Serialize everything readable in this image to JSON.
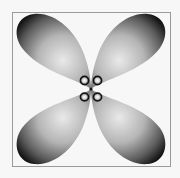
{
  "diagram": {
    "lobe_count": 4,
    "inner_lobe_count": 4,
    "orientation": "diagonal",
    "colors": {
      "background": "#f7f7f7",
      "frame": "#9a9a9a",
      "lobe_highlight": "#e8e8e8",
      "lobe_mid": "#9c9c9c",
      "lobe_edge": "#1c1c1c"
    }
  }
}
